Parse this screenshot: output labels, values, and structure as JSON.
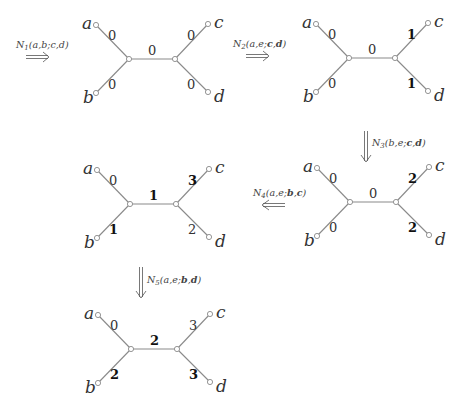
{
  "header": {
    "cut_off_text": ""
  },
  "operations": [
    {
      "id": "N1",
      "label": "N₁(a,b;c,d)",
      "sub": "1",
      "args": "(a,b;c,d)",
      "bold_args": [],
      "direction": "right"
    },
    {
      "id": "N2",
      "label": "N₂(a,e;c,d)",
      "sub": "2",
      "args": "(a,e;c,d)",
      "bold_args": [
        "c",
        "d"
      ],
      "direction": "right"
    },
    {
      "id": "N3",
      "label": "N₃(b,e;c,d)",
      "sub": "3",
      "args": "(b,e;c,d)",
      "bold_args": [
        "c",
        "d"
      ],
      "direction": "down"
    },
    {
      "id": "N4",
      "label": "N₄(a,e;b,c)",
      "sub": "4",
      "args": "(a,e;b,c)",
      "bold_args": [
        "b",
        "c"
      ],
      "direction": "left"
    },
    {
      "id": "N5",
      "label": "N₅(a,e;b,d)",
      "sub": "5",
      "args": "(a,e;b,d)",
      "bold_args": [
        "b",
        "d"
      ],
      "direction": "down"
    }
  ],
  "trees": [
    {
      "id": "tree-0",
      "leaves": [
        "a",
        "b",
        "c",
        "d"
      ],
      "weights": {
        "a": "0",
        "b": "0",
        "center": "0",
        "c": "0",
        "d": "0"
      },
      "bold": []
    },
    {
      "id": "tree-1",
      "leaves": [
        "a",
        "b",
        "c",
        "d"
      ],
      "weights": {
        "a": "0",
        "b": "0",
        "center": "0",
        "c": "1",
        "d": "1"
      },
      "bold": [
        "c",
        "d"
      ]
    },
    {
      "id": "tree-2",
      "leaves": [
        "a",
        "b",
        "c",
        "d"
      ],
      "weights": {
        "a": "0",
        "b": "0",
        "center": "0",
        "c": "2",
        "d": "2"
      },
      "bold": [
        "c",
        "d"
      ]
    },
    {
      "id": "tree-3",
      "leaves": [
        "a",
        "b",
        "c",
        "d"
      ],
      "weights": {
        "a": "0",
        "b": "1",
        "center": "1",
        "c": "3",
        "d": "2"
      },
      "bold": [
        "b",
        "center",
        "c"
      ]
    },
    {
      "id": "tree-4",
      "leaves": [
        "a",
        "b",
        "c",
        "d"
      ],
      "weights": {
        "a": "0",
        "b": "2",
        "center": "2",
        "c": "3",
        "d": "3"
      },
      "bold": [
        "b",
        "center",
        "d"
      ]
    }
  ],
  "colors": {
    "edge": "#8a8a8a",
    "text": "#333333",
    "bold_text": "#111111",
    "background": "#ffffff"
  }
}
